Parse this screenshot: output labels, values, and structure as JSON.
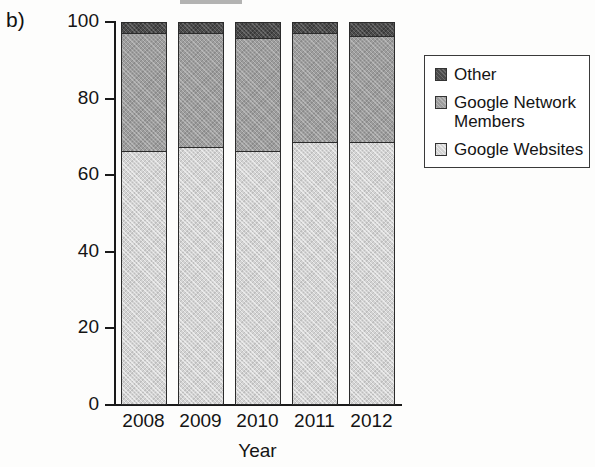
{
  "panel": {
    "label": "b)"
  },
  "chart_data": {
    "type": "bar",
    "subtype": "stacked-bar-100-percent",
    "title": "",
    "xlabel": "Year",
    "ylabel": "Percentage",
    "categories": [
      "2008",
      "2009",
      "2010",
      "2011",
      "2012"
    ],
    "ylim": [
      0,
      100
    ],
    "yticks": [
      0,
      20,
      40,
      60,
      80,
      100
    ],
    "ytick_labels": [
      "0",
      "20",
      "40",
      "60",
      "80",
      "100"
    ],
    "grid": false,
    "legend_position": "right",
    "series": [
      {
        "name": "Google Websites",
        "color": "#d3d3d3",
        "values": [
          66,
          67,
          66,
          68.5,
          68.5
        ]
      },
      {
        "name": "Google Network Members",
        "color": "#9d9d9d",
        "values": [
          31,
          30,
          29.5,
          28.5,
          27.5
        ]
      },
      {
        "name": "Other",
        "color": "#4b4b4b",
        "values": [
          3,
          3,
          4.5,
          3,
          4
        ]
      }
    ]
  },
  "legend": {
    "items": [
      {
        "label": "Other",
        "swatch": "other-swatch"
      },
      {
        "label": "Google Network Members",
        "swatch": "network-swatch"
      },
      {
        "label": "Google Websites",
        "swatch": "websites-swatch"
      }
    ]
  }
}
